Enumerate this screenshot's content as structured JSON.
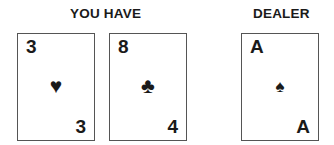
{
  "player": {
    "heading": "YOU HAVE",
    "cards": [
      {
        "rank_top": "3",
        "suit": "♥",
        "suit_name": "hearts",
        "rank_bottom": "3"
      },
      {
        "rank_top": "8",
        "suit": "♣",
        "suit_name": "clubs",
        "rank_bottom": "4"
      }
    ]
  },
  "dealer": {
    "heading": "DEALER",
    "cards": [
      {
        "rank_top": "A",
        "suit": "♠",
        "suit_name": "spades",
        "rank_bottom": "A"
      }
    ]
  }
}
